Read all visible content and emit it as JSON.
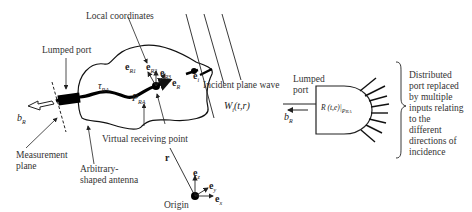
{
  "diagram": {
    "left_panel": {
      "labels": {
        "local_coordinates": "Local coordinates",
        "lumped_port": "Lumped port",
        "measurement_plane_line1": "Measurement",
        "measurement_plane_line2": "plane",
        "arbitrary_antenna_line1": "Arbitrary-",
        "arbitrary_antenna_line2": "shaped antenna",
        "virtual_receiving_point": "Virtual receiving  point",
        "incident_plane_wave": "Incident plane wave",
        "origin": "Origin"
      },
      "symbols": {
        "b_R": "b",
        "b_R_sub": "R",
        "tau_RA": "τ",
        "tau_RA_sub": "RA",
        "P_RA": "P",
        "P_RA_sub": "RA",
        "e_R1": "e",
        "e_R1_sub": "R1",
        "e_R2": "e",
        "e_R2_sub": "R2",
        "e_R3": "e",
        "e_R3_sub": "R3",
        "e_R": "e",
        "e_R_sub": "R",
        "e_i": "e",
        "e_i_sub": "i",
        "W_i": "W",
        "W_i_sub": "i",
        "W_i_args": "(t,r)",
        "r": "r",
        "e_z": "e",
        "e_z_sub": "z",
        "e_y": "e",
        "e_y_sub": "y",
        "e_x": "e",
        "e_x_sub": "x"
      }
    },
    "right_panel": {
      "labels": {
        "lumped_port_line1": "Lumped",
        "lumped_port_line2": "port",
        "block_text": "R (t,e)|",
        "block_text_sub": "P",
        "block_text_sub2": "RA",
        "description": [
          "Distributed",
          "port replaced",
          "by multiple",
          "inputs relating",
          "to the",
          "different",
          "directions of",
          "incidence"
        ]
      },
      "symbols": {
        "b_R": "b",
        "b_R_sub": "R"
      },
      "input_line_count": 8
    }
  }
}
